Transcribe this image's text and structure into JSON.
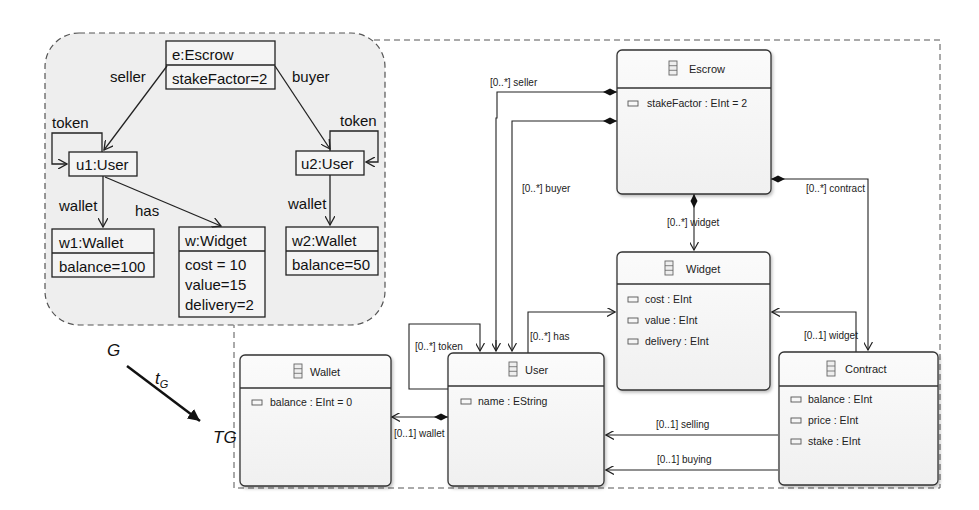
{
  "instance_graph": {
    "label": "G",
    "objects": {
      "escrow": {
        "name": "e:Escrow",
        "attrs": [
          "stakeFactor=2"
        ]
      },
      "u1": {
        "name": "u1:User"
      },
      "u2": {
        "name": "u2:User"
      },
      "w1": {
        "name": "w1:Wallet",
        "attrs": [
          "balance=100"
        ]
      },
      "w": {
        "name": "w:Widget",
        "attrs": [
          "cost = 10",
          "value=15",
          "delivery=2"
        ]
      },
      "w2": {
        "name": "w2:Wallet",
        "attrs": [
          "balance=50"
        ]
      }
    },
    "edges": {
      "seller": "seller",
      "buyer": "buyer",
      "token1": "token",
      "token2": "token",
      "wallet1": "wallet",
      "wallet2": "wallet",
      "has": "has"
    }
  },
  "typing": {
    "morphism": "t",
    "morphism_sub": "G",
    "type_graph_label": "TG"
  },
  "type_graph": {
    "classes": {
      "escrow": {
        "name": "Escrow",
        "attrs": [
          "stakeFactor : EInt = 2"
        ]
      },
      "widget": {
        "name": "Widget",
        "attrs": [
          "cost : EInt",
          "value : EInt",
          "delivery : EInt"
        ]
      },
      "user": {
        "name": "User",
        "attrs": [
          "name : EString"
        ]
      },
      "wallet": {
        "name": "Wallet",
        "attrs": [
          "balance : EInt = 0"
        ]
      },
      "contract": {
        "name": "Contract",
        "attrs": [
          "balance : EInt",
          "price : EInt",
          "stake : EInt"
        ]
      }
    },
    "references": {
      "seller": "[0..*] seller",
      "buyer": "[0..*] buyer",
      "widget": "[0..*] widget",
      "contract": "[0..*] contract",
      "token": "[0..*] token",
      "has": "[0..*] has",
      "contract_widget": "[0..1] widget",
      "wallet": "[0..1] wallet",
      "selling": "[0..1] selling",
      "buying": "[0..1] buying"
    }
  }
}
